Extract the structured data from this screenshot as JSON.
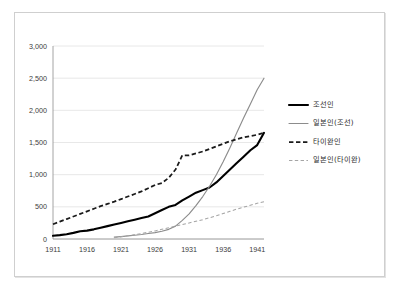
{
  "chart_data": {
    "type": "line",
    "title": "",
    "subtitle": "",
    "xlabel": "",
    "ylabel": "",
    "xlim": [
      1911,
      1942
    ],
    "ylim": [
      0,
      3000
    ],
    "grid": true,
    "legend_position": "right",
    "y_ticks": [
      "0",
      "500",
      "1,000",
      "1,500",
      "2,000",
      "2,500",
      "3,000"
    ],
    "y_tick_values": [
      0,
      500,
      1000,
      1500,
      2000,
      2500,
      3000
    ],
    "x_ticks": [
      "1911",
      "1916",
      "1921",
      "1926",
      "1931",
      "1936",
      "1941"
    ],
    "x_tick_values": [
      1911,
      1916,
      1921,
      1926,
      1931,
      1936,
      1941
    ],
    "series": [
      {
        "name": "조선인",
        "style": "solid-thick-black",
        "color": "#000000",
        "x": [
          1911,
          1912,
          1913,
          1914,
          1915,
          1916,
          1917,
          1918,
          1919,
          1920,
          1921,
          1922,
          1923,
          1924,
          1925,
          1926,
          1927,
          1928,
          1929,
          1930,
          1931,
          1932,
          1933,
          1934,
          1935,
          1936,
          1937,
          1938,
          1939,
          1940,
          1941,
          1942
        ],
        "values": [
          50,
          60,
          75,
          95,
          120,
          130,
          150,
          175,
          200,
          225,
          250,
          275,
          300,
          325,
          350,
          400,
          450,
          500,
          530,
          600,
          660,
          720,
          760,
          800,
          880,
          980,
          1080,
          1180,
          1280,
          1380,
          1460,
          1650
        ]
      },
      {
        "name": "일본인(조선)",
        "style": "solid-thin-gray",
        "color": "#8c8c8c",
        "x": [
          1920,
          1921,
          1922,
          1923,
          1924,
          1925,
          1926,
          1927,
          1928,
          1929,
          1930,
          1931,
          1932,
          1933,
          1934,
          1935,
          1936,
          1937,
          1938,
          1939,
          1940,
          1941,
          1942
        ],
        "values": [
          30,
          38,
          48,
          58,
          70,
          85,
          100,
          120,
          150,
          200,
          290,
          390,
          520,
          660,
          820,
          1000,
          1200,
          1420,
          1650,
          1880,
          2100,
          2320,
          2500
        ]
      },
      {
        "name": "타이완인",
        "style": "dashed-thick-black",
        "color": "#1a1a1a",
        "x": [
          1911,
          1912,
          1913,
          1914,
          1915,
          1916,
          1917,
          1918,
          1919,
          1920,
          1921,
          1922,
          1923,
          1924,
          1925,
          1926,
          1927,
          1928,
          1929,
          1930,
          1931,
          1932,
          1933,
          1934,
          1935,
          1936,
          1937,
          1938,
          1939,
          1940,
          1941,
          1942
        ],
        "values": [
          230,
          270,
          310,
          350,
          390,
          430,
          470,
          510,
          545,
          580,
          620,
          660,
          700,
          740,
          790,
          840,
          870,
          950,
          1080,
          1300,
          1300,
          1330,
          1360,
          1400,
          1440,
          1480,
          1520,
          1550,
          1580,
          1600,
          1620,
          1650
        ]
      },
      {
        "name": "일본인(타이완)",
        "style": "dashed-thin-gray",
        "color": "#a5a5a5",
        "x": [
          1920,
          1921,
          1922,
          1923,
          1924,
          1925,
          1926,
          1927,
          1928,
          1929,
          1930,
          1931,
          1932,
          1933,
          1934,
          1935,
          1936,
          1937,
          1938,
          1939,
          1940,
          1941,
          1942
        ],
        "values": [
          20,
          35,
          50,
          68,
          85,
          105,
          125,
          150,
          175,
          200,
          225,
          250,
          275,
          300,
          330,
          360,
          395,
          430,
          465,
          495,
          525,
          555,
          580
        ]
      }
    ]
  },
  "legend": {
    "items": [
      {
        "label": "조선인"
      },
      {
        "label": "일본인(조선)"
      },
      {
        "label": "타이완인"
      },
      {
        "label": "일본인(타이완)"
      }
    ]
  }
}
